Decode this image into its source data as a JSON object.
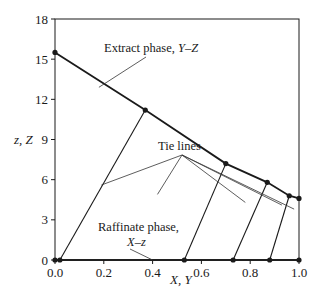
{
  "chart_data": {
    "type": "line",
    "title": "",
    "xlabel": "X, Y",
    "ylabel": "z, Z",
    "xlim": [
      0.0,
      1.0
    ],
    "ylim": [
      0,
      18
    ],
    "x_ticks": [
      "0.0",
      "0.2",
      "0.4",
      "0.6",
      "0.8",
      "1.0"
    ],
    "y_ticks": [
      "0",
      "3",
      "6",
      "9",
      "12",
      "15",
      "18"
    ],
    "grid": false,
    "legend": null,
    "series": [
      {
        "name": "Extract phase, Y–Z",
        "points": [
          [
            0.0,
            15.5
          ],
          [
            0.37,
            11.2
          ],
          [
            0.7,
            7.2
          ],
          [
            0.87,
            5.8
          ],
          [
            0.96,
            4.8
          ],
          [
            1.0,
            4.6
          ]
        ]
      },
      {
        "name": "Raffinate phase, X–z",
        "points": [
          [
            0.0,
            0.0
          ],
          [
            0.02,
            0.0
          ],
          [
            0.53,
            0.0
          ],
          [
            0.73,
            0.0
          ],
          [
            0.88,
            0.0
          ],
          [
            1.0,
            0.0
          ]
        ]
      }
    ],
    "tie_lines": [
      [
        [
          0.02,
          0.0
        ],
        [
          0.37,
          11.2
        ]
      ],
      [
        [
          0.53,
          0.0
        ],
        [
          0.7,
          7.2
        ]
      ],
      [
        [
          0.73,
          0.0
        ],
        [
          0.87,
          5.8
        ]
      ],
      [
        [
          0.88,
          0.0
        ],
        [
          0.96,
          4.8
        ]
      ]
    ],
    "annotations": [
      {
        "text": "Extract phase, ",
        "italic_part": "Y–Z",
        "label_pos": [
          0.24,
          16.8
        ],
        "arrow_to": [
          0.18,
          12.9
        ]
      },
      {
        "text": "Tie lines",
        "label_pos": [
          0.38,
          7.5
        ],
        "arrows_to": [
          [
            0.19,
            5.6
          ],
          [
            0.42,
            4.9
          ],
          [
            0.78,
            4.3
          ],
          [
            0.93,
            4.1
          ],
          [
            0.98,
            3.8
          ]
        ]
      },
      {
        "text": "Raffinate phase,",
        "italic_line2": "X–z",
        "label_pos": [
          0.32,
          2.5
        ],
        "arrow_to": [
          0.4,
          0.0
        ]
      }
    ]
  },
  "labels": {
    "extract_main": "Extract phase, ",
    "extract_italic": "Y–Z",
    "tie_lines": "Tie lines",
    "raffinate_line1": "Raffinate phase,",
    "raffinate_line2": "X–z",
    "x_axis_title": "X, Y",
    "y_axis_title": "z, Z"
  }
}
